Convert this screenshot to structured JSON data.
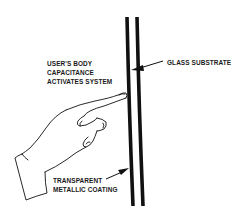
{
  "diagram": {
    "type": "touch-screen-capacitance-illustration",
    "colors": {
      "ink": "#111111",
      "background": "#ffffff"
    },
    "labels": {
      "user_body": [
        "USER'S BODY",
        "CAPACITANCE",
        "ACTIVATES SYSTEM"
      ],
      "glass": "GLASS SUBSTRATE",
      "coating": [
        "TRANSPARENT",
        "METALLIC COATING"
      ]
    },
    "elements": [
      {
        "id": "hand",
        "description": "pointing hand touching the coated surface"
      },
      {
        "id": "metallic-coating-layer",
        "description": "inner curved vertical line"
      },
      {
        "id": "glass-substrate-layer",
        "description": "outer curved vertical line"
      },
      {
        "id": "arrow-glass",
        "points_to": "glass-substrate-layer"
      },
      {
        "id": "arrow-coating",
        "points_to": "metallic-coating-layer"
      }
    ]
  }
}
